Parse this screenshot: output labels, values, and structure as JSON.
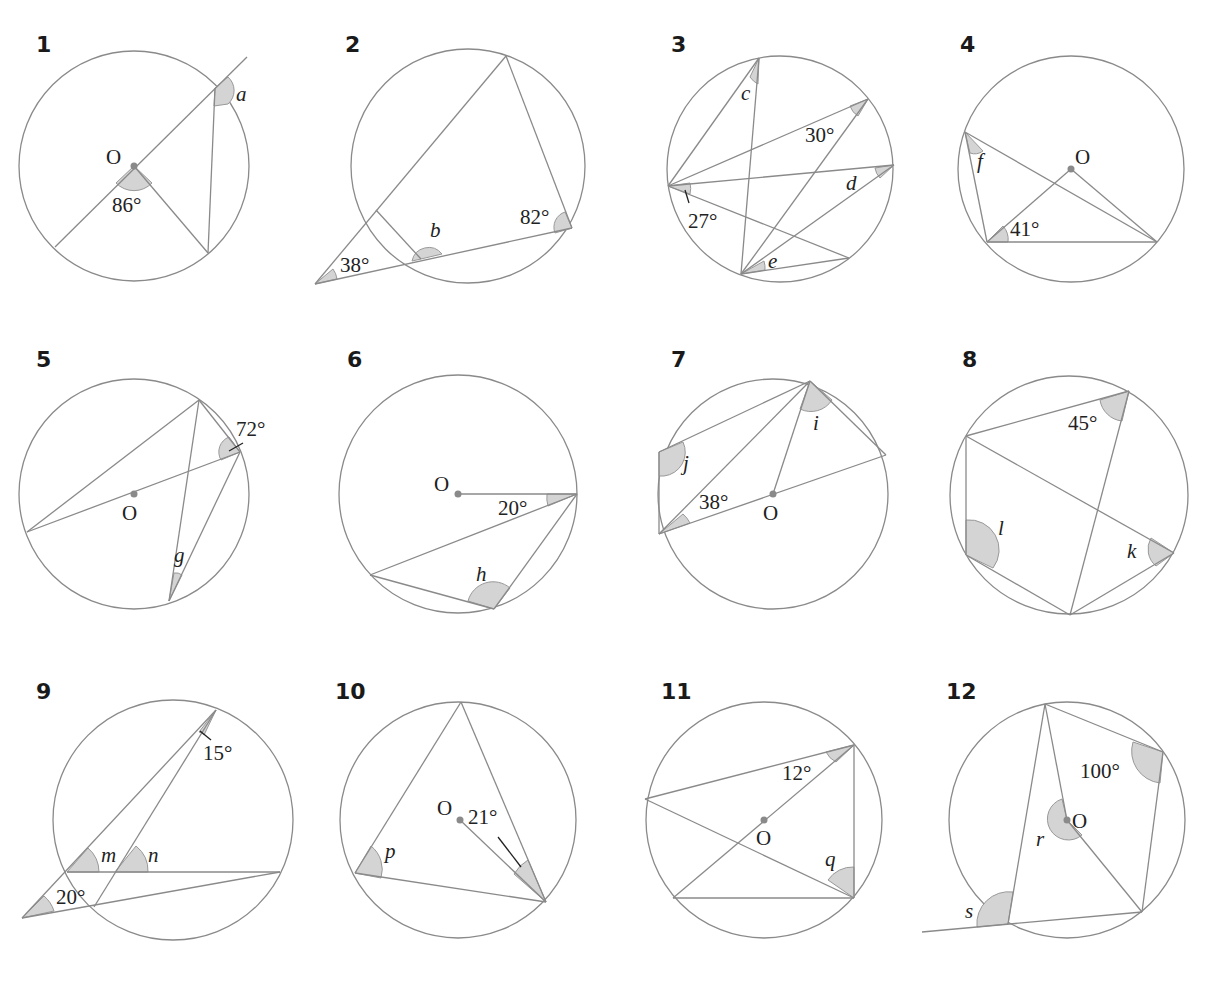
{
  "problems": [
    {
      "number": "1",
      "centre_label": "O",
      "given": [
        "86°"
      ],
      "unknowns": [
        "a"
      ]
    },
    {
      "number": "2",
      "given": [
        "38°",
        "82°"
      ],
      "unknowns": [
        "b"
      ]
    },
    {
      "number": "3",
      "given": [
        "30°",
        "27°"
      ],
      "unknowns": [
        "c",
        "d",
        "e"
      ]
    },
    {
      "number": "4",
      "centre_label": "O",
      "given": [
        "41°"
      ],
      "unknowns": [
        "f"
      ]
    },
    {
      "number": "5",
      "centre_label": "O",
      "given": [
        "72°"
      ],
      "unknowns": [
        "g"
      ]
    },
    {
      "number": "6",
      "centre_label": "O",
      "given": [
        "20°"
      ],
      "unknowns": [
        "h"
      ]
    },
    {
      "number": "7",
      "centre_label": "O",
      "given": [
        "38°"
      ],
      "unknowns": [
        "i",
        "j"
      ]
    },
    {
      "number": "8",
      "given": [
        "45°"
      ],
      "unknowns": [
        "k",
        "l"
      ]
    },
    {
      "number": "9",
      "given": [
        "15°",
        "20°"
      ],
      "unknowns": [
        "m",
        "n"
      ]
    },
    {
      "number": "10",
      "centre_label": "O",
      "given": [
        "21°"
      ],
      "unknowns": [
        "p"
      ]
    },
    {
      "number": "11",
      "centre_label": "O",
      "given": [
        "12°"
      ],
      "unknowns": [
        "q"
      ]
    },
    {
      "number": "12",
      "centre_label": "O",
      "given": [
        "100°"
      ],
      "unknowns": [
        "r",
        "s"
      ]
    }
  ],
  "colors": {
    "line": "#8a8a8a",
    "angle_fill": "#d4d4d4",
    "text": "#222222"
  }
}
